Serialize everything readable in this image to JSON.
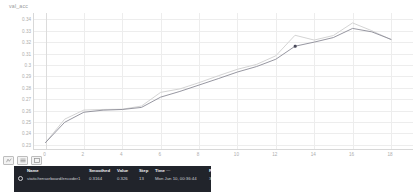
{
  "chart_data": {
    "type": "line",
    "title": "val_acc",
    "xlabel": "",
    "ylabel": "",
    "grid": true,
    "legend_position": "none",
    "xlim": [
      -0.6,
      19.2
    ],
    "ylim": [
      0.2255,
      0.3455
    ],
    "xticks": [
      0,
      2,
      4,
      6,
      8,
      10,
      12,
      14,
      16,
      18
    ],
    "yticks": [
      0.23,
      0.24,
      0.25,
      0.26,
      0.27,
      0.28,
      0.29,
      0.3,
      0.31,
      0.32,
      0.33,
      0.34
    ],
    "ytick_labels": [
      "0.23",
      "0.24",
      "0.25",
      "0.26",
      "0.27",
      "0.28",
      "0.29",
      "0.3",
      "0.31",
      "0.32",
      "0.33",
      "0.34"
    ],
    "xtick_labels": [
      "0",
      "2",
      "4",
      "6",
      "8",
      "10",
      "12",
      "14",
      "16",
      "18"
    ],
    "x": [
      0,
      1,
      2,
      3,
      4,
      5,
      6,
      7,
      8,
      9,
      10,
      11,
      12,
      13,
      14,
      15,
      16,
      17,
      18
    ],
    "series": [
      {
        "name": "val_acc (raw)",
        "color": "#cfcfcf",
        "values": [
          0.232,
          0.2525,
          0.2605,
          0.261,
          0.2612,
          0.264,
          0.276,
          0.279,
          0.2845,
          0.2905,
          0.2962,
          0.3005,
          0.308,
          0.326,
          0.3218,
          0.3258,
          0.3368,
          0.33,
          0.3222
        ]
      },
      {
        "name": "val_acc (smoothed)",
        "color": "#8b8b96",
        "values": [
          0.232,
          0.2498,
          0.2586,
          0.2604,
          0.261,
          0.2628,
          0.2718,
          0.2768,
          0.2824,
          0.288,
          0.2938,
          0.2986,
          0.305,
          0.3164,
          0.32,
          0.324,
          0.332,
          0.329,
          0.3224
        ]
      }
    ],
    "hover_point": {
      "x": 13,
      "y": 0.3164
    }
  },
  "toolbar": {
    "items": [
      {
        "name": "fit-domain-icon",
        "label": ""
      },
      {
        "name": "list-icon",
        "label": ""
      },
      {
        "name": "expand-icon",
        "label": ""
      }
    ]
  },
  "tooltip": {
    "headers": {
      "swatch": "",
      "name": "Name",
      "smoothed": "Smoothed",
      "value": "Value",
      "step": "Step",
      "time": "Time",
      "relative": "Relative"
    },
    "sort_caret": "—",
    "rows": [
      {
        "swatch_color": "#cfcfd4",
        "name": "static/tensorboard/encoder1",
        "smoothed": "0.3164",
        "value": "0.326",
        "step": "13",
        "time": "Mon Jun 10, 00:36:44",
        "relative": "34s"
      }
    ]
  }
}
